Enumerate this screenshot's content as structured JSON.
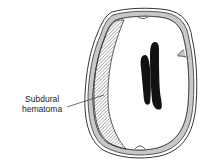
{
  "figure": {
    "labels": [
      {
        "id": "subdural-hematoma",
        "line1": "Subdural",
        "line2": "hematoma"
      }
    ]
  },
  "colors": {
    "outline": "#333333",
    "bone_fill": "#c8c8c8",
    "hematoma_hatch": "#555555",
    "ventricle": "#111111",
    "background": "#ffffff"
  }
}
